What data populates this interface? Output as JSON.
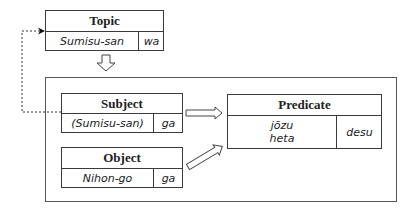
{
  "diagram": {
    "topic": {
      "title": "Topic",
      "noun": "Sumisu-san",
      "particle": "wa"
    },
    "subject": {
      "title": "Subject",
      "noun": "(Sumisu-san)",
      "particle": "ga"
    },
    "object": {
      "title": "Object",
      "noun": "Nihon-go",
      "particle": "ga"
    },
    "predicate": {
      "title": "Predicate",
      "word1": "jōzu",
      "word2": "heta",
      "copula": "desu"
    }
  },
  "colors": {
    "line": "#3a3a3a",
    "background": "#ffffff",
    "text": "#222222"
  }
}
